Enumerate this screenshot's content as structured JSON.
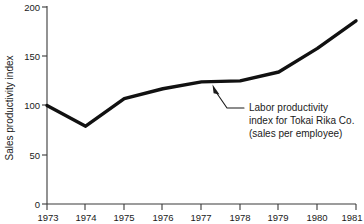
{
  "chart_data": {
    "type": "line",
    "title": "",
    "xlabel": "",
    "ylabel": "Sales productivity index",
    "categories": [
      "1973",
      "1974",
      "1975",
      "1976",
      "1977",
      "1978",
      "1979",
      "1980",
      "1981"
    ],
    "x": [
      1973,
      1974,
      1975,
      1976,
      1977,
      1978,
      1979,
      1980,
      1981
    ],
    "values": [
      100,
      79,
      107,
      117,
      124,
      125,
      134,
      158,
      186
    ],
    "series": [
      {
        "name": "Labor productivity index for Tokai Rika Co. (sales per employee)",
        "values": [
          100,
          79,
          107,
          117,
          124,
          125,
          134,
          158,
          186
        ]
      }
    ],
    "ylim": [
      0,
      200
    ],
    "xlim": [
      1973,
      1981
    ],
    "yticks": [
      0,
      50,
      100,
      150,
      200
    ],
    "ytick_labels": [
      "0",
      "50",
      "100",
      "150",
      "200"
    ],
    "xticks": [
      1973,
      1974,
      1975,
      1976,
      1977,
      1978,
      1979,
      1980,
      1981
    ],
    "xtick_labels": [
      "1973",
      "1974",
      "1975",
      "1976",
      "1977",
      "1978",
      "1979",
      "1980",
      "1981"
    ],
    "grid": false,
    "legend": false,
    "legend_position": "none",
    "line_color": "#111111",
    "axis_color": "#3a3a3a",
    "background_color": "#ffffff",
    "annotations": [
      {
        "lines": [
          "Labor productivity",
          "index for Tokai Rika Co.",
          "(sales per employee)"
        ],
        "points_to_year": 1977.5,
        "points_to_value": 124
      }
    ]
  },
  "yaxis": {
    "title": "Sales productivity index",
    "labels": [
      "200",
      "150",
      "100",
      "50",
      "0"
    ]
  },
  "xaxis": {
    "labels": [
      "1973",
      "1974",
      "1975",
      "1976",
      "1977",
      "1978",
      "1979",
      "1980",
      "1981"
    ]
  },
  "annotation": {
    "line1": "Labor productivity",
    "line2": "index for Tokai Rika Co.",
    "line3": "(sales per employee)"
  }
}
